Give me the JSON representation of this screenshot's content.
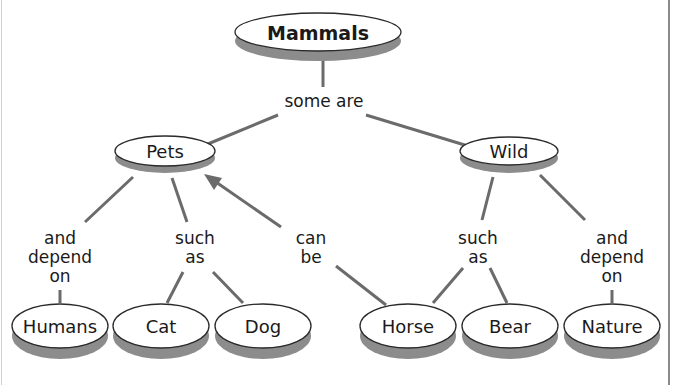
{
  "diagram": {
    "type": "concept-map",
    "root": {
      "label": "Mammals"
    },
    "root_link": {
      "label": "some are"
    },
    "categories": [
      {
        "label": "Pets",
        "links": [
          {
            "lines": [
              "and",
              "depend",
              "on"
            ],
            "targets": [
              "Humans"
            ]
          },
          {
            "lines": [
              "such",
              "as"
            ],
            "targets": [
              "Cat",
              "Dog"
            ]
          }
        ]
      },
      {
        "label": "Wild",
        "links": [
          {
            "lines": [
              "such",
              "as"
            ],
            "targets": [
              "Horse",
              "Bear"
            ]
          },
          {
            "lines": [
              "and",
              "depend",
              "on"
            ],
            "targets": [
              "Nature"
            ]
          }
        ]
      }
    ],
    "cross_link": {
      "lines": [
        "can",
        "be"
      ],
      "from": "Horse",
      "to": "Pets",
      "arrow": true
    },
    "leaves": [
      "Humans",
      "Cat",
      "Dog",
      "Horse",
      "Bear",
      "Nature"
    ],
    "colors": {
      "edge": "#6b6b6b",
      "shadow": "#8c8c8c",
      "node_fill": "#ffffff",
      "border": "#8a8a8a"
    }
  }
}
